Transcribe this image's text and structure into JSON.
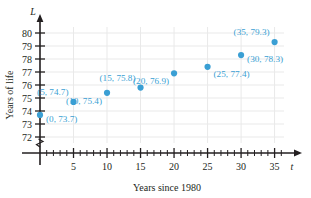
{
  "chart_data": {
    "type": "scatter",
    "title": "",
    "xlabel": "Years since 1980",
    "ylabel": "Years of life",
    "x_axis_variable": "t",
    "y_axis_variable": "L",
    "xlim": [
      0,
      37
    ],
    "ylim": [
      71.5,
      80.5
    ],
    "y_axis_break": true,
    "grid": true,
    "legend": "none",
    "x_major_ticks": [
      5,
      10,
      15,
      20,
      25,
      30,
      35
    ],
    "x_minor_tick_step": 1,
    "y_ticks": [
      72,
      73,
      74,
      75,
      76,
      77,
      78,
      79,
      80
    ],
    "x_tick_labels": [
      "5",
      "10",
      "15",
      "20",
      "25",
      "30",
      "35"
    ],
    "y_tick_labels": [
      "72",
      "73",
      "74",
      "75",
      "76",
      "77",
      "78",
      "79",
      "80"
    ],
    "x": [
      0,
      5,
      10,
      15,
      20,
      25,
      30,
      35
    ],
    "values": [
      73.7,
      74.7,
      75.4,
      75.8,
      76.9,
      77.4,
      78.3,
      79.3
    ],
    "points": [
      {
        "x": 0,
        "y": 73.7,
        "label": "(0, 73.7)",
        "label_pos": "right"
      },
      {
        "x": 5,
        "y": 74.7,
        "label": "(5, 74.7)",
        "label_pos": "above-left"
      },
      {
        "x": 10,
        "y": 75.4,
        "label": "(10, 75.4)",
        "label_pos": "below-left"
      },
      {
        "x": 15,
        "y": 75.8,
        "label": "(15, 75.8)",
        "label_pos": "above-left"
      },
      {
        "x": 20,
        "y": 76.9,
        "label": "(20, 76.9)",
        "label_pos": "below-left"
      },
      {
        "x": 25,
        "y": 77.4,
        "label": "(25, 77.4)",
        "label_pos": "below-right"
      },
      {
        "x": 30,
        "y": 78.3,
        "label": "(30, 78.3)",
        "label_pos": "right"
      },
      {
        "x": 35,
        "y": 79.3,
        "label": "(35, 79.3)",
        "label_pos": "above-left"
      }
    ],
    "colors": {
      "point": "#3a9fd4",
      "label": "#3a9fd4",
      "grid": "#e9e9e9",
      "axis": "#231f20",
      "background": "#ffffff"
    }
  }
}
